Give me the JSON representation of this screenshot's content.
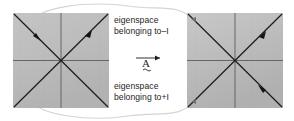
{
  "figure": {
    "title_top": "eigenspace",
    "labels": {
      "top_line1": "eigenspace",
      "top_line2": "belonging to–I",
      "bottom_line1": "eigenspace",
      "bottom_line2": "belonging to+I"
    },
    "operator": {
      "symbol": "A",
      "accent": "tilde-under",
      "arrow": "right-arrow-over"
    },
    "colors": {
      "panel_fill": "#b9b9b9",
      "panel_fill_light": "#c6c6c6",
      "axis_line": "#4a4a4a",
      "diagonal_line": "#1d1d1d",
      "connector_curve": "#d2d2d2",
      "text": "#262626",
      "background": "#ffffff"
    },
    "panels": [
      {
        "name": "left-panel",
        "role": "domain",
        "x": 13,
        "y": 13,
        "width": 96,
        "height": 95,
        "arrowheads": [
          {
            "on": "anti-diagonal",
            "direction": "down-right-inward"
          },
          {
            "on": "main-diagonal",
            "direction": "up-right-outward"
          }
        ]
      },
      {
        "name": "right-panel",
        "role": "image",
        "x": 187,
        "y": 13,
        "width": 96,
        "height": 95,
        "arrowheads": [
          {
            "on": "main-diagonal",
            "direction": "up-right-outward"
          },
          {
            "on": "main-diagonal-lower",
            "direction": "down-right-outward"
          }
        ]
      }
    ],
    "connectors": [
      {
        "name": "top-connector-curve",
        "from": "left-panel-top-left",
        "to": "right-panel-top-left",
        "arrow": true
      },
      {
        "name": "bottom-connector-curve",
        "from": "left-panel-bottom-left",
        "to": "right-panel-bottom-left",
        "arrow": true
      }
    ]
  }
}
